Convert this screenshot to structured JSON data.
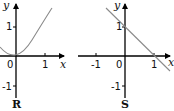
{
  "graphs": [
    {
      "name": "R",
      "function": "y = x^2",
      "x_axis_label": "x",
      "y_axis_label": "y",
      "origin_label": "0",
      "x_ticks": [
        "1"
      ],
      "y_ticks": [
        "1",
        "-1"
      ],
      "curve_color": "#8a8a8a"
    },
    {
      "name": "S",
      "function": "y = 1 - x",
      "x_axis_label": "x",
      "y_axis_label": "y",
      "origin_label": "0",
      "x_ticks": [
        "-1",
        "1"
      ],
      "y_ticks": [
        "1",
        "-1"
      ],
      "curve_color": "#8a8a8a"
    }
  ]
}
